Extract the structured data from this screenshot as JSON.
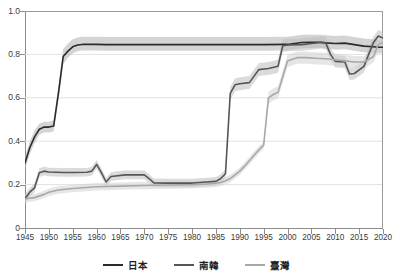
{
  "chart_data": {
    "type": "line",
    "title": "",
    "xlabel": "",
    "ylabel": "",
    "xlim": [
      1945,
      2020
    ],
    "ylim": [
      0,
      1.0
    ],
    "grid": true,
    "grid_axis": "y",
    "legend_position": "bottom",
    "x_ticks": [
      "1945",
      "1950",
      "1955",
      "1960",
      "1965",
      "1970",
      "1975",
      "1980",
      "1985",
      "1990",
      "1995",
      "2000",
      "2005",
      "2010",
      "2015",
      "2020"
    ],
    "y_ticks": [
      "0",
      "0.2",
      "0.4",
      "0.6",
      "0.8",
      "1.0"
    ],
    "y_tick_values": [
      0,
      0.2,
      0.4,
      0.6,
      0.8,
      1.0
    ],
    "bands": "shaded confidence interval around each series",
    "series": [
      {
        "name": "日本",
        "color": "#2b2b2b",
        "band_color": "#b0b0b0",
        "x": [
          1945,
          1946,
          1947,
          1948,
          1949,
          1950,
          1951,
          1952,
          1953,
          1954,
          1955,
          1956,
          1957,
          1958,
          1960,
          1962,
          1965,
          1970,
          1975,
          1980,
          1985,
          1990,
          1995,
          2000,
          2003,
          2005,
          2007,
          2008,
          2010,
          2012,
          2014,
          2016,
          2018,
          2019,
          2020
        ],
        "values": [
          0.3,
          0.37,
          0.42,
          0.455,
          0.465,
          0.465,
          0.47,
          0.62,
          0.79,
          0.815,
          0.835,
          0.843,
          0.846,
          0.846,
          0.846,
          0.845,
          0.845,
          0.845,
          0.845,
          0.845,
          0.845,
          0.845,
          0.845,
          0.846,
          0.855,
          0.856,
          0.856,
          0.853,
          0.85,
          0.852,
          0.845,
          0.838,
          0.835,
          0.833,
          0.833
        ],
        "band_lower": [
          0.27,
          0.34,
          0.39,
          0.43,
          0.44,
          0.44,
          0.445,
          0.59,
          0.755,
          0.785,
          0.805,
          0.815,
          0.818,
          0.818,
          0.818,
          0.817,
          0.817,
          0.817,
          0.817,
          0.817,
          0.817,
          0.817,
          0.817,
          0.818,
          0.828,
          0.829,
          0.829,
          0.826,
          0.822,
          0.824,
          0.817,
          0.81,
          0.807,
          0.805,
          0.805
        ],
        "band_upper": [
          0.33,
          0.4,
          0.45,
          0.48,
          0.49,
          0.49,
          0.495,
          0.65,
          0.825,
          0.85,
          0.87,
          0.878,
          0.881,
          0.881,
          0.881,
          0.88,
          0.88,
          0.88,
          0.88,
          0.88,
          0.88,
          0.88,
          0.88,
          0.881,
          0.89,
          0.891,
          0.891,
          0.888,
          0.885,
          0.887,
          0.88,
          0.873,
          0.87,
          0.868,
          0.868
        ]
      },
      {
        "name": "南韓",
        "color": "#565656",
        "band_color": "#bdbdbd",
        "x": [
          1945,
          1946,
          1947,
          1948,
          1949,
          1950,
          1953,
          1955,
          1958,
          1959,
          1960,
          1961,
          1962,
          1963,
          1964,
          1966,
          1968,
          1970,
          1971,
          1972,
          1975,
          1980,
          1983,
          1985,
          1986,
          1987,
          1988,
          1989,
          1990,
          1992,
          1994,
          1996,
          1998,
          1999,
          2000,
          2003,
          2005,
          2007,
          2008,
          2009,
          2010,
          2012,
          2013,
          2014,
          2016,
          2017,
          2018,
          2019,
          2020
        ],
        "values": [
          0.135,
          0.165,
          0.185,
          0.255,
          0.262,
          0.258,
          0.256,
          0.256,
          0.257,
          0.262,
          0.293,
          0.255,
          0.212,
          0.237,
          0.24,
          0.245,
          0.245,
          0.245,
          0.228,
          0.208,
          0.207,
          0.207,
          0.212,
          0.215,
          0.228,
          0.25,
          0.62,
          0.66,
          0.665,
          0.67,
          0.73,
          0.735,
          0.745,
          0.84,
          0.843,
          0.845,
          0.85,
          0.855,
          0.853,
          0.8,
          0.768,
          0.765,
          0.71,
          0.712,
          0.745,
          0.8,
          0.855,
          0.885,
          0.875
        ],
        "band_lower": [
          0.115,
          0.145,
          0.165,
          0.235,
          0.242,
          0.238,
          0.236,
          0.236,
          0.237,
          0.242,
          0.273,
          0.235,
          0.192,
          0.217,
          0.22,
          0.225,
          0.225,
          0.225,
          0.208,
          0.188,
          0.187,
          0.187,
          0.192,
          0.195,
          0.208,
          0.23,
          0.59,
          0.63,
          0.635,
          0.64,
          0.7,
          0.705,
          0.715,
          0.812,
          0.815,
          0.817,
          0.822,
          0.827,
          0.825,
          0.772,
          0.74,
          0.737,
          0.682,
          0.684,
          0.717,
          0.772,
          0.827,
          0.857,
          0.847
        ],
        "band_upper": [
          0.155,
          0.185,
          0.205,
          0.275,
          0.282,
          0.278,
          0.276,
          0.276,
          0.277,
          0.282,
          0.313,
          0.275,
          0.232,
          0.257,
          0.26,
          0.265,
          0.265,
          0.265,
          0.248,
          0.228,
          0.227,
          0.227,
          0.232,
          0.235,
          0.248,
          0.27,
          0.65,
          0.69,
          0.695,
          0.7,
          0.76,
          0.765,
          0.775,
          0.868,
          0.871,
          0.873,
          0.878,
          0.883,
          0.881,
          0.828,
          0.796,
          0.793,
          0.738,
          0.74,
          0.773,
          0.828,
          0.883,
          0.913,
          0.903
        ]
      },
      {
        "name": "臺灣",
        "color": "#a8a8a8",
        "band_color": "#d2d2d2",
        "x": [
          1945,
          1947,
          1949,
          1950,
          1952,
          1955,
          1960,
          1965,
          1970,
          1975,
          1980,
          1983,
          1985,
          1986,
          1987,
          1988,
          1989,
          1990,
          1991,
          1992,
          1993,
          1994,
          1995,
          1996,
          1997,
          1998,
          2000,
          2002,
          2004,
          2006,
          2008,
          2010,
          2012,
          2014,
          2016,
          2018,
          2019,
          2020
        ],
        "values": [
          0.135,
          0.14,
          0.155,
          0.165,
          0.175,
          0.182,
          0.19,
          0.193,
          0.196,
          0.198,
          0.2,
          0.203,
          0.206,
          0.21,
          0.218,
          0.228,
          0.245,
          0.262,
          0.285,
          0.31,
          0.335,
          0.36,
          0.382,
          0.6,
          0.615,
          0.625,
          0.77,
          0.785,
          0.785,
          0.782,
          0.78,
          0.775,
          0.77,
          0.765,
          0.765,
          0.79,
          0.845,
          0.855
        ],
        "band_lower": [
          0.118,
          0.123,
          0.138,
          0.148,
          0.158,
          0.165,
          0.173,
          0.176,
          0.179,
          0.181,
          0.183,
          0.186,
          0.189,
          0.193,
          0.201,
          0.211,
          0.228,
          0.245,
          0.268,
          0.293,
          0.318,
          0.343,
          0.365,
          0.572,
          0.587,
          0.597,
          0.742,
          0.757,
          0.757,
          0.754,
          0.752,
          0.747,
          0.742,
          0.737,
          0.737,
          0.762,
          0.817,
          0.827
        ],
        "band_upper": [
          0.152,
          0.157,
          0.172,
          0.182,
          0.192,
          0.199,
          0.207,
          0.21,
          0.213,
          0.215,
          0.217,
          0.22,
          0.223,
          0.227,
          0.235,
          0.245,
          0.262,
          0.279,
          0.302,
          0.327,
          0.352,
          0.377,
          0.399,
          0.628,
          0.643,
          0.653,
          0.798,
          0.813,
          0.813,
          0.81,
          0.808,
          0.803,
          0.798,
          0.793,
          0.793,
          0.818,
          0.873,
          0.883
        ]
      }
    ]
  },
  "legend": {
    "items": [
      {
        "label": "日本",
        "color": "#2b2b2b"
      },
      {
        "label": "南韓",
        "color": "#565656"
      },
      {
        "label": "臺灣",
        "color": "#a8a8a8"
      }
    ]
  },
  "axes": {
    "y_labels": [
      "1.0",
      "0.8",
      "0.6",
      "0.4",
      "0.2",
      "0"
    ],
    "x_labels": [
      "1945",
      "1950",
      "1955",
      "1960",
      "1965",
      "1970",
      "1975",
      "1980",
      "1985",
      "1990",
      "1995",
      "2000",
      "2005",
      "2010",
      "2015",
      "2020"
    ]
  },
  "title": {
    "text": ""
  }
}
